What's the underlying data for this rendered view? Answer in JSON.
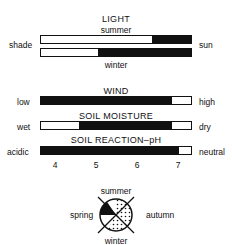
{
  "light": {
    "title": "LIGHT",
    "summer_label": "summer",
    "winter_label": "winter",
    "left_label": "shade",
    "right_label": "sun",
    "summer_fill": {
      "start": 0.74,
      "end": 1.0
    },
    "winter_fill": {
      "start": 0.38,
      "end": 1.0
    }
  },
  "wind": {
    "title": "WIND",
    "left_label": "low",
    "right_label": "high",
    "fill": {
      "start": 0.0,
      "end": 0.87
    }
  },
  "soil_moisture": {
    "title": "SOIL MOISTURE",
    "left_label": "wet",
    "right_label": "dry",
    "fill": {
      "start": 0.25,
      "end": 0.87
    }
  },
  "soil_reaction": {
    "title": "SOIL REACTION–pH",
    "left_label": "acidic",
    "right_label": "neutral",
    "fill": {
      "start": 0.0,
      "end": 0.92
    },
    "ticks": [
      "4",
      "5",
      "6",
      "7"
    ]
  },
  "seasons": {
    "top": "summer",
    "left": "spring",
    "right": "autumn",
    "bottom": "winter"
  }
}
